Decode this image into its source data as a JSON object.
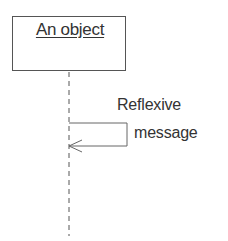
{
  "diagram": {
    "type": "uml-sequence-fragment",
    "object": {
      "label": "An object"
    },
    "lifeline": {
      "style": "dashed"
    },
    "message": {
      "kind": "reflexive",
      "label_line1": "Reflexive",
      "label_line2": "message",
      "arrowhead": "open"
    },
    "colors": {
      "stroke": "#555555",
      "text": "#333333",
      "background": "#ffffff"
    }
  }
}
